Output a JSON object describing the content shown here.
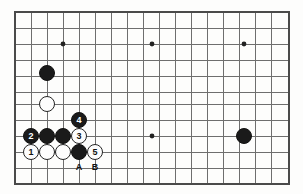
{
  "figure": {
    "kind": "go-board-diagram",
    "board_rect": {
      "left": 15,
      "top": 12,
      "right": 289,
      "bottom": 184
    },
    "grid_spacing": 16,
    "stone_diameter": 16,
    "colors": {
      "board_background": "#fdfdfc",
      "line": "#6e6e6e",
      "border": "#4a4a4a",
      "black_stone": "#1a1a1a",
      "white_stone": "#fdfdfd",
      "white_stone_edge": "#242424",
      "star_point": "#222222",
      "label_text": "#111111"
    },
    "grid": {
      "vertical_x": [
        15,
        31,
        47,
        63,
        79,
        95,
        111,
        127,
        143,
        159,
        175,
        191,
        207,
        223,
        239,
        255,
        271,
        289
      ],
      "horizontal_y": [
        12,
        28,
        44,
        60,
        76,
        92,
        108,
        124,
        140,
        156,
        172,
        184
      ],
      "line_rows_y": [
        12,
        28,
        44,
        60,
        76,
        92,
        104,
        120,
        136,
        152,
        168,
        184
      ]
    },
    "star_points": [
      {
        "name": "star-upper-left",
        "x": 63,
        "y": 44
      },
      {
        "name": "star-upper-middle",
        "x": 152,
        "y": 44
      },
      {
        "name": "star-upper-right",
        "x": 244,
        "y": 44
      },
      {
        "name": "star-lower-middle",
        "x": 152,
        "y": 136
      }
    ],
    "stones": [
      {
        "name": "black-stone-upper-left",
        "color": "black",
        "x": 47,
        "y": 73,
        "label": ""
      },
      {
        "name": "white-stone-left",
        "color": "white",
        "x": 47,
        "y": 104,
        "label": ""
      },
      {
        "name": "black-stone-move-4",
        "color": "black",
        "x": 79,
        "y": 120,
        "label": "4"
      },
      {
        "name": "black-stone-move-2",
        "color": "black",
        "x": 31,
        "y": 136,
        "label": "2"
      },
      {
        "name": "black-stone-row-mid-1",
        "color": "black",
        "x": 47,
        "y": 136,
        "label": ""
      },
      {
        "name": "black-stone-row-mid-2",
        "color": "black",
        "x": 63,
        "y": 136,
        "label": ""
      },
      {
        "name": "white-stone-move-3",
        "color": "white",
        "x": 79,
        "y": 136,
        "label": "3"
      },
      {
        "name": "white-stone-move-1",
        "color": "white",
        "x": 31,
        "y": 152,
        "label": "1"
      },
      {
        "name": "white-stone-bottom-1",
        "color": "white",
        "x": 47,
        "y": 152,
        "label": ""
      },
      {
        "name": "white-stone-bottom-2",
        "color": "white",
        "x": 63,
        "y": 152,
        "label": ""
      },
      {
        "name": "black-stone-bottom",
        "color": "black",
        "x": 79,
        "y": 152,
        "label": ""
      },
      {
        "name": "white-stone-move-5",
        "color": "white",
        "x": 95,
        "y": 152,
        "label": "5"
      },
      {
        "name": "black-stone-lower-right",
        "color": "black",
        "x": 244,
        "y": 136,
        "label": ""
      }
    ],
    "coordinate_labels": [
      {
        "name": "point-label-a",
        "text": "A",
        "x": 79,
        "y": 168
      },
      {
        "name": "point-label-b",
        "text": "B",
        "x": 95,
        "y": 168
      }
    ]
  }
}
